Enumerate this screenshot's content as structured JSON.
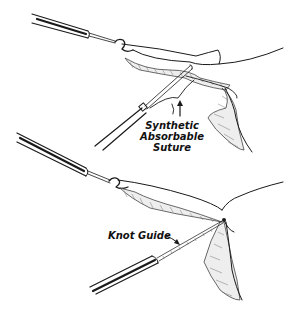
{
  "figure": {
    "type": "medical line illustration",
    "panels": [
      {
        "id": "top",
        "description": "Grasping forceps holding tissue pedicle while a suture applicator passes synthetic absorbable suture around it",
        "labels": [
          {
            "text_lines": [
              "Synthetic",
              "Absorbable",
              "Suture"
            ],
            "pointer": "upward arrow"
          }
        ]
      },
      {
        "id": "bottom",
        "description": "Knot pushed down with a knot guide to tie off the tissue pedicle",
        "labels": [
          {
            "text": "Knot Guide",
            "pointer": "arrow to instrument shaft"
          }
        ]
      }
    ]
  },
  "labels": {
    "suture_line1": "Synthetic",
    "suture_line2": "Absorbable",
    "suture_line3": "Suture",
    "knot_guide": "Knot Guide"
  },
  "colors": {
    "ink": "#1a1a1a",
    "background": "#ffffff"
  }
}
